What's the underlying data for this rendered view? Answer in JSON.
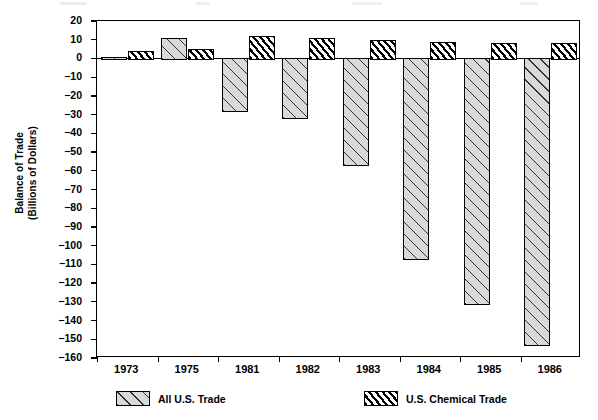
{
  "chart_data": {
    "type": "bar",
    "title": "",
    "subtitle": "",
    "xlabel": "",
    "ylabel": "Balance of Trade (Billions of Dollars)",
    "ylabel_lines": [
      "Balance of Trade",
      "(Billions of Dollars)"
    ],
    "categories": [
      "1973",
      "1975",
      "1981",
      "1982",
      "1983",
      "1984",
      "1985",
      "1986"
    ],
    "series": [
      {
        "name": "All U.S. Trade",
        "fill": "gray-wide-diagonal-hatch",
        "color": "#d9d9d9",
        "values": [
          1,
          11,
          -28,
          -32,
          -57,
          -107,
          -131,
          -153
        ]
      },
      {
        "name": "U.S. Chemical Trade",
        "fill": "dense-diagonal-hatch",
        "color": "#ffffff",
        "values": [
          4,
          5,
          12,
          11,
          10,
          9,
          8,
          8
        ]
      }
    ],
    "ylim": [
      -160,
      20
    ],
    "yticks": [
      20,
      10,
      0,
      -10,
      -20,
      -30,
      -40,
      -50,
      -60,
      -70,
      -80,
      -90,
      -100,
      -110,
      -120,
      -130,
      -140,
      -150,
      -160
    ],
    "ytick_labels": [
      "20",
      "10",
      "0",
      "-10",
      "-20",
      "-30",
      "-40",
      "-50",
      "-60",
      "-70",
      "-80",
      "-90",
      "-100",
      "-110",
      "-120",
      "-130",
      "-140",
      "-150",
      "-160"
    ],
    "grid": false,
    "legend_position": "bottom",
    "zero_line": true
  },
  "legend": {
    "items": [
      {
        "label": "All U.S. Trade",
        "style": "all"
      },
      {
        "label": "U.S. Chemical Trade",
        "style": "chem"
      }
    ]
  }
}
